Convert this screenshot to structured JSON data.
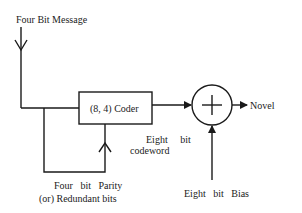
{
  "diagram": {
    "type": "block-diagram",
    "nodes": {
      "input_label": "Four Bit Message",
      "coder_label": "(8, 4) Coder",
      "adder_symbol": "+",
      "output_label": "Novel"
    },
    "edge_labels": {
      "codeword_line1": "Eight     bit",
      "codeword_line2": "codeword",
      "bias_label": "Eight   bit   Bias",
      "parity_line1": "Four   bit   Parity",
      "parity_line2": "(or) Redundant bits"
    },
    "edges": [
      {
        "from": "Four Bit Message",
        "to": "(8, 4) Coder"
      },
      {
        "from": "(8, 4) Coder",
        "to": "+",
        "label": "Eight bit codeword"
      },
      {
        "from": "Eight bit Bias",
        "to": "+"
      },
      {
        "from": "+",
        "to": "Novel"
      },
      {
        "from": "feedback loop",
        "to": "(8, 4) Coder",
        "label": "Four bit Parity (or) Redundant bits"
      }
    ]
  }
}
